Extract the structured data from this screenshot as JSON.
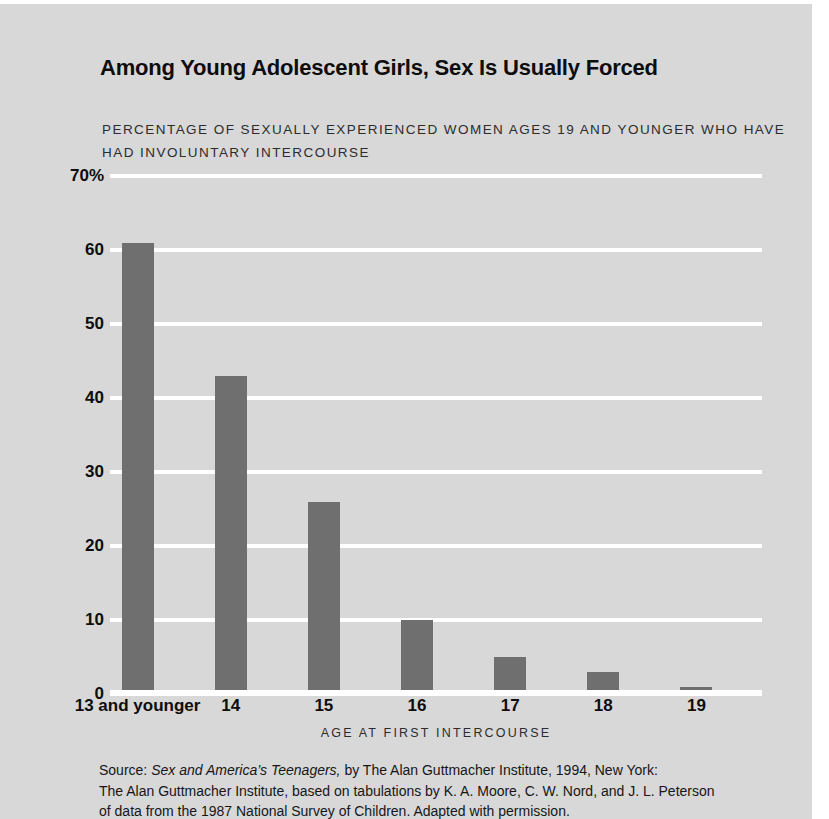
{
  "chart_data": {
    "type": "bar",
    "title": "Among Young Adolescent Girls, Sex Is Usually Forced",
    "subtitle": "PERCENTAGE OF SEXUALLY EXPERIENCED WOMEN AGES 19 AND YOUNGER WHO HAVE HAD INVOLUNTARY INTERCOURSE",
    "xlabel": "AGE AT FIRST INTERCOURSE",
    "ylabel": "",
    "ylim": [
      0,
      70
    ],
    "yticks": [
      0,
      10,
      20,
      30,
      40,
      50,
      60,
      70
    ],
    "ytick_labels": [
      "0",
      "10",
      "20",
      "30",
      "40",
      "50",
      "60",
      "70%"
    ],
    "grid": true,
    "legend": false,
    "categories": [
      "13 and younger",
      "14",
      "15",
      "16",
      "17",
      "18",
      "19"
    ],
    "values": [
      61,
      43,
      26,
      10,
      5,
      3,
      1
    ],
    "bar_color": "#6f6f70",
    "background_color": "#d8d8d9",
    "gridline_color": "#ffffff"
  },
  "source": {
    "prefix": "Source: ",
    "italic_work": "Sex and America’s Teenagers,",
    "line1_rest": " by The Alan Guttmacher Institute, 1994, New York:",
    "line2": "The Alan Guttmacher Institute, based on tabulations by K. A. Moore, C. W. Nord, and J. L. Peterson",
    "line3": "of data from the 1987 National Survey of Children. Adapted with permission."
  }
}
